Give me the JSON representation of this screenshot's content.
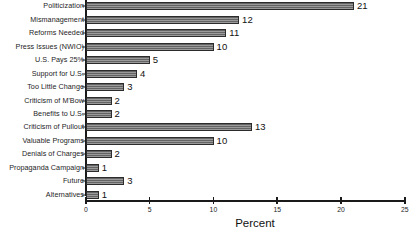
{
  "chart_data": {
    "type": "bar",
    "orientation": "horizontal",
    "title": "",
    "xlabel": "Percent",
    "ylabel": "",
    "xlim": [
      0,
      25
    ],
    "xticks": [
      0,
      5,
      10,
      15,
      20,
      25
    ],
    "grid": false,
    "legend": null,
    "bar_color": "#6f6f6f",
    "bar_edge_color": "#2c2c2c",
    "axis_color": "#1a1a1a",
    "background": "#ffffff",
    "categories": [
      "Politicization",
      "Mismanagement",
      "Reforms Needed",
      "Press Issues (NWIO)",
      "U.S. Pays 25%",
      "Support for U.S.",
      "Too Little Change",
      "Criticism of M'Bow",
      "Benefits to U.S.",
      "Criticism of Pullout",
      "Valuable Programs",
      "Denials of Charges",
      "Propaganda Campaign",
      "Future",
      "Alternatives"
    ],
    "values": [
      21,
      12,
      11,
      10,
      5,
      4,
      3,
      2,
      2,
      13,
      10,
      2,
      1,
      3,
      1
    ],
    "value_labels": [
      "21",
      "12",
      "11",
      "10",
      "5",
      "4",
      "3",
      "2",
      "2",
      "13",
      "10",
      "2",
      "1",
      "3",
      "1"
    ],
    "xtick_labels": [
      "0",
      "5",
      "10",
      "15",
      "20",
      "25"
    ]
  }
}
